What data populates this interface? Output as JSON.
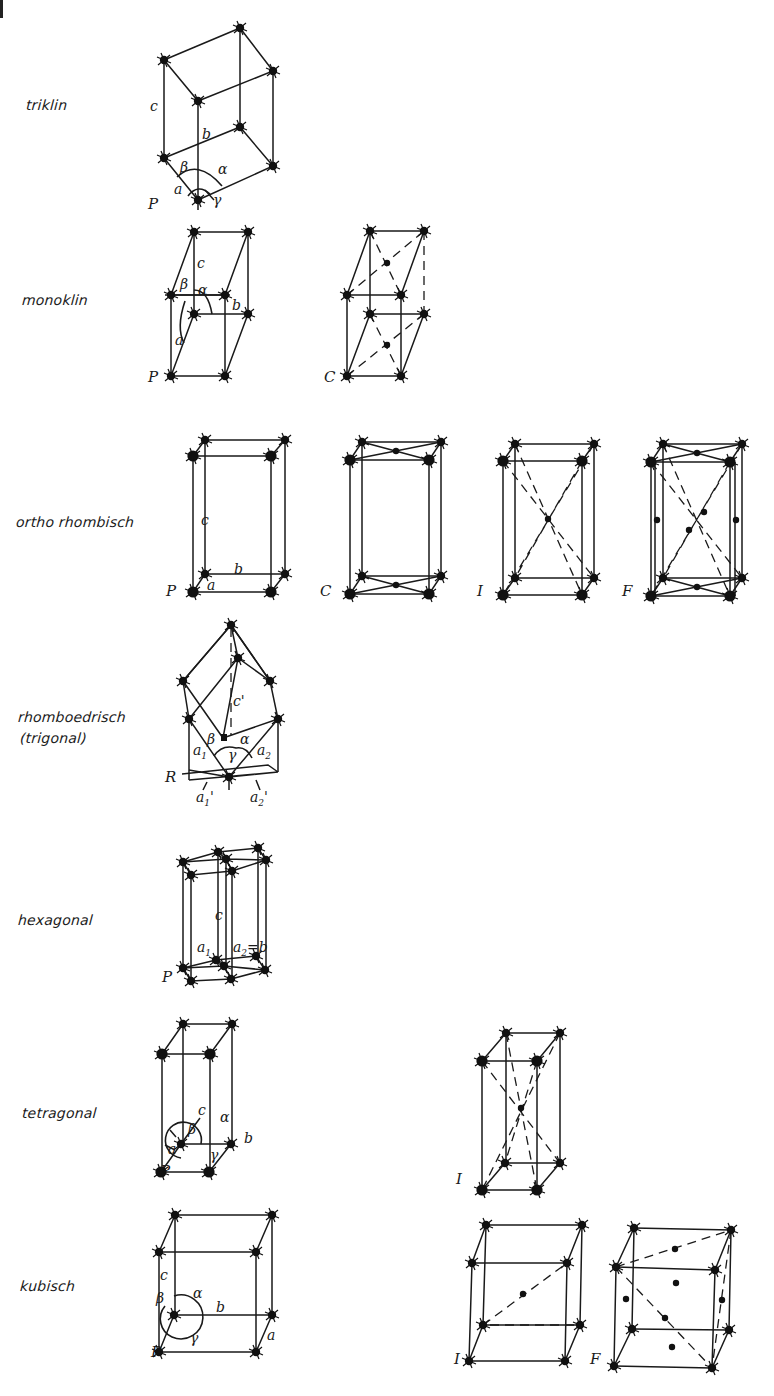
{
  "figure": {
    "colors": {
      "ink": "#1a1a1a",
      "background": "#ffffff"
    }
  },
  "systems": [
    {
      "id": "triclinic",
      "label": "triklin",
      "lattices": [
        "P"
      ],
      "axes": [
        "a",
        "b",
        "c"
      ],
      "angles": [
        "α",
        "β",
        "γ"
      ]
    },
    {
      "id": "monoclinic",
      "label": "monoklin",
      "lattices": [
        "P",
        "C"
      ],
      "axes": [
        "a",
        "b",
        "c"
      ],
      "angles": [
        "α",
        "β"
      ]
    },
    {
      "id": "orthorhombic",
      "label": "ortho rhombisch",
      "lattices": [
        "P",
        "C",
        "I",
        "F"
      ],
      "axes": [
        "a",
        "b",
        "c"
      ]
    },
    {
      "id": "rhombohedral",
      "label": "rhomboedrisch",
      "label2": "(trigonal)",
      "lattices": [
        "R"
      ],
      "axes": [
        "a₁",
        "a₂",
        "c'",
        "a'₁",
        "a'₂"
      ],
      "angles": [
        "α",
        "β",
        "γ"
      ]
    },
    {
      "id": "hexagonal",
      "label": "hexagonal",
      "lattices": [
        "P"
      ],
      "axes": [
        "a₁",
        "a₂=b",
        "c"
      ]
    },
    {
      "id": "tetragonal",
      "label": "tetragonal",
      "lattices": [
        "P",
        "I"
      ],
      "axes": [
        "a",
        "b",
        "c"
      ],
      "angles": [
        "α",
        "β",
        "γ"
      ]
    },
    {
      "id": "cubic",
      "label": "kubisch",
      "lattices": [
        "P",
        "I",
        "F"
      ],
      "axes": [
        "a",
        "b",
        "c"
      ],
      "angles": [
        "α",
        "β",
        "γ"
      ]
    }
  ],
  "symbols": {
    "alpha": "α",
    "beta": "β",
    "gamma": "γ",
    "a": "a",
    "b": "b",
    "c": "c",
    "c_prime": "c'",
    "a1": "a",
    "a2": "a",
    "sub1": "1",
    "sub2": "2",
    "a2b": "=b"
  }
}
